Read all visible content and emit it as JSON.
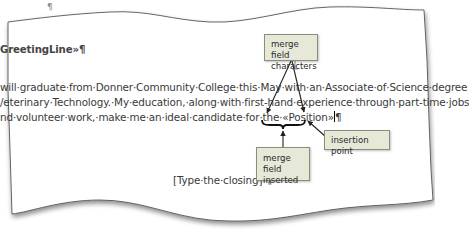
{
  "document": {
    "top_mark": "¶",
    "greeting_line": "GreetingLine»¶",
    "body_lines": [
      "will graduate from Donner Community College this May with an Associate of Science degree",
      "Veterinary Technology. My education, along with first-hand experience through part-time jobs",
      "nd volunteer work, make me an ideal candidate for the «Position»¶"
    ],
    "body_line_1": "will·graduate·from·Donner·Community·College·this·May·with·an·Associate·of·Science·degree",
    "body_line_2": "/eterinary·Technology.·My·education,·along·with·first-hand·experience·through·part-time·jobs",
    "body_line_3_prefix": "nd·volunteer·work,·make·me·an·ideal·candidate·for·the·",
    "merge_field": "«Position»",
    "pilcrow": "¶",
    "closing": "[Type·the·closing]·¶"
  },
  "callouts": {
    "merge_field_characters": "merge field characters",
    "merge_field_characters_lines": [
      "merge field",
      "characters"
    ],
    "merge_field_inserted_lines": [
      "merge field",
      "inserted"
    ],
    "insertion_point": "insertion point"
  },
  "colors": {
    "callout_fill": "#e6e8d8",
    "callout_border": "#8b8d78",
    "text": "#3a3a3a",
    "page_edge": "#555555"
  }
}
